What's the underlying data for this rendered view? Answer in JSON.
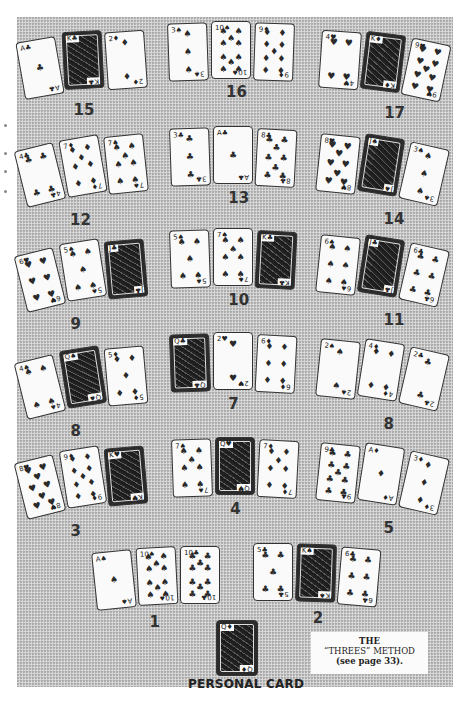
{
  "figure": {
    "caption": {
      "line1": "THE",
      "line2": "“THREES” METHOD",
      "line3": "(see page 33)."
    },
    "personal_card": {
      "label": "PERSONAL CARD",
      "rank": "Q",
      "suit": "diamonds",
      "face": true
    },
    "groups": [
      {
        "number": "15",
        "x": 20,
        "y": 30,
        "rot": [
          -10,
          -3,
          -4
        ],
        "cards": [
          {
            "rank": "A",
            "suit": "♣",
            "face": false
          },
          {
            "rank": "K",
            "suit": "♣",
            "face": true
          },
          {
            "rank": "2",
            "suit": "♦",
            "face": false
          }
        ]
      },
      {
        "number": "16",
        "x": 168,
        "y": 21,
        "rot": [
          -2,
          0,
          2
        ],
        "cards": [
          {
            "rank": "3",
            "suit": "♠",
            "face": false
          },
          {
            "rank": "10",
            "suit": "♠",
            "face": false
          },
          {
            "rank": "9",
            "suit": "♦",
            "face": false
          }
        ]
      },
      {
        "number": "17",
        "x": 320,
        "y": 30,
        "rot": [
          4,
          7,
          12
        ],
        "cards": [
          {
            "rank": "4",
            "suit": "♥",
            "face": false
          },
          {
            "rank": "K",
            "suit": "♦",
            "face": true
          },
          {
            "rank": "9",
            "suit": "♥",
            "face": false
          }
        ]
      },
      {
        "number": "12",
        "x": 20,
        "y": 133,
        "rot": [
          -14,
          -10,
          -6
        ],
        "cards": [
          {
            "rank": "4",
            "suit": "♣",
            "face": false
          },
          {
            "rank": "7",
            "suit": "♦",
            "face": false
          },
          {
            "rank": "7",
            "suit": "♠",
            "face": false
          }
        ]
      },
      {
        "number": "13",
        "x": 170,
        "y": 126,
        "rot": [
          -2,
          0,
          3
        ],
        "cards": [
          {
            "rank": "3",
            "suit": "♣",
            "face": false
          },
          {
            "rank": "A",
            "suit": "♣",
            "face": false
          },
          {
            "rank": "8",
            "suit": "♣",
            "face": false
          }
        ]
      },
      {
        "number": "14",
        "x": 318,
        "y": 133,
        "rot": [
          6,
          9,
          13
        ],
        "cards": [
          {
            "rank": "8",
            "suit": "♥",
            "face": false
          },
          {
            "rank": "J",
            "suit": "♠",
            "face": true
          },
          {
            "rank": "3",
            "suit": "♠",
            "face": false
          }
        ]
      },
      {
        "number": "9",
        "x": 20,
        "y": 238,
        "rot": [
          -14,
          -9,
          -5
        ],
        "cards": [
          {
            "rank": "6",
            "suit": "♥",
            "face": false
          },
          {
            "rank": "5",
            "suit": "♠",
            "face": false
          },
          {
            "rank": "J",
            "suit": "♣",
            "face": true
          }
        ]
      },
      {
        "number": "10",
        "x": 170,
        "y": 228,
        "rot": [
          -2,
          0,
          3
        ],
        "cards": [
          {
            "rank": "5",
            "suit": "♠",
            "face": false
          },
          {
            "rank": "7",
            "suit": "♠",
            "face": false
          },
          {
            "rank": "K",
            "suit": "♣",
            "face": true
          }
        ]
      },
      {
        "number": "11",
        "x": 318,
        "y": 234,
        "rot": [
          6,
          9,
          13
        ],
        "cards": [
          {
            "rank": "6",
            "suit": "♠",
            "face": false
          },
          {
            "rank": "J",
            "suit": "♣",
            "face": true
          },
          {
            "rank": "6",
            "suit": "♣",
            "face": false
          }
        ]
      },
      {
        "number": "8",
        "x": 20,
        "y": 345,
        "rot": [
          -14,
          -9,
          -5
        ],
        "cards": [
          {
            "rank": "4",
            "suit": "♠",
            "face": false
          },
          {
            "rank": "Q",
            "suit": "♠",
            "face": true
          },
          {
            "rank": "5",
            "suit": "♦",
            "face": false
          }
        ]
      },
      {
        "number": "7",
        "x": 170,
        "y": 332,
        "rot": [
          -2,
          0,
          3
        ],
        "cards": [
          {
            "rank": "Q",
            "suit": "♣",
            "face": true
          },
          {
            "rank": "2",
            "suit": "♥",
            "face": false
          },
          {
            "rank": "6",
            "suit": "♦",
            "face": false
          }
        ]
      },
      {
        "number": "8",
        "x": 318,
        "y": 338,
        "rot": [
          6,
          9,
          13
        ],
        "cards": [
          {
            "rank": "2",
            "suit": "♠",
            "face": false
          },
          {
            "rank": "4",
            "suit": "♦",
            "face": false
          },
          {
            "rank": "2",
            "suit": "♣",
            "face": false
          }
        ]
      },
      {
        "number": "3",
        "x": 20,
        "y": 445,
        "rot": [
          -14,
          -9,
          -5
        ],
        "cards": [
          {
            "rank": "8",
            "suit": "♥",
            "face": false
          },
          {
            "rank": "9",
            "suit": "♦",
            "face": false
          },
          {
            "rank": "K",
            "suit": "♥",
            "face": true
          }
        ]
      },
      {
        "number": "4",
        "x": 172,
        "y": 437,
        "rot": [
          -2,
          0,
          3
        ],
        "cards": [
          {
            "rank": "7",
            "suit": "♠",
            "face": false
          },
          {
            "rank": "Q",
            "suit": "♥",
            "face": true
          },
          {
            "rank": "7",
            "suit": "♦",
            "face": false
          }
        ]
      },
      {
        "number": "5",
        "x": 318,
        "y": 442,
        "rot": [
          6,
          9,
          13
        ],
        "cards": [
          {
            "rank": "9",
            "suit": "♣",
            "face": false
          },
          {
            "rank": "A",
            "suit": "♦",
            "face": false
          },
          {
            "rank": "3",
            "suit": "♦",
            "face": false
          }
        ]
      },
      {
        "number": "1",
        "x": 94,
        "y": 546,
        "rot": [
          -6,
          -3,
          0
        ],
        "cards": [
          {
            "rank": "A",
            "suit": "♠",
            "face": false
          },
          {
            "rank": "10",
            "suit": "♠",
            "face": false
          },
          {
            "rank": "10",
            "suit": "♣",
            "face": false
          }
        ]
      },
      {
        "number": "2",
        "x": 253,
        "y": 543,
        "rot": [
          0,
          2,
          5
        ],
        "cards": [
          {
            "rank": "5",
            "suit": "♣",
            "face": false
          },
          {
            "rank": "K",
            "suit": "♠",
            "face": true
          },
          {
            "rank": "6",
            "suit": "♣",
            "face": false
          }
        ]
      }
    ]
  }
}
